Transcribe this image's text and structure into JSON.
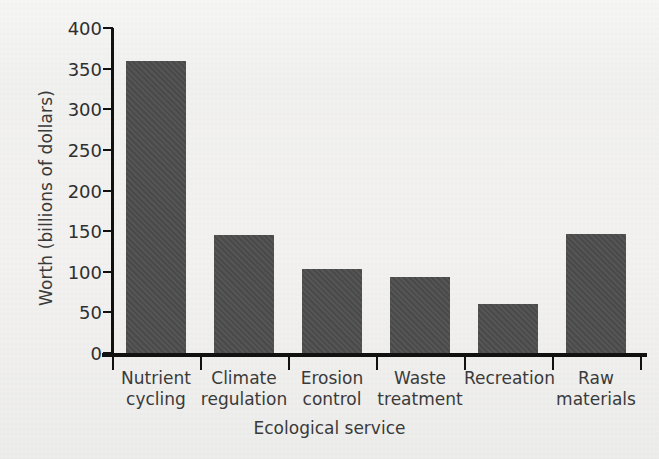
{
  "chart_data": {
    "type": "bar",
    "title": "",
    "xlabel": "Ecological service",
    "ylabel": "Worth (billions of dollars)",
    "categories": [
      "Nutrient cycling",
      "Climate regulation",
      "Erosion control",
      "Waste treatment",
      "Recreation",
      "Raw materials"
    ],
    "category_lines": [
      [
        "Nutrient",
        "cycling"
      ],
      [
        "Climate",
        "regulation"
      ],
      [
        "Erosion",
        "control"
      ],
      [
        "Waste",
        "treatment"
      ],
      [
        "Recreation",
        ""
      ],
      [
        "Raw",
        "materials"
      ]
    ],
    "values": [
      360,
      145,
      103,
      93,
      60,
      147
    ],
    "ylim": [
      0,
      400
    ],
    "yticks": [
      0,
      50,
      100,
      150,
      200,
      250,
      300,
      350,
      400
    ],
    "ytick_labels": [
      "0",
      "50",
      "100",
      "150",
      "200",
      "250",
      "300",
      "350",
      "400"
    ],
    "grid": false,
    "legend": false,
    "bar_color": "#4d4d4d",
    "axis_color": "#111111",
    "background_color": "#f2f2f0"
  }
}
